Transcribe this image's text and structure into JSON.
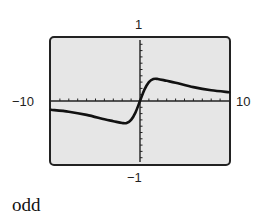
{
  "chart_data": {
    "type": "line",
    "title": "",
    "xlabel": "",
    "ylabel": "",
    "xlim": [
      -10,
      10
    ],
    "ylim": [
      -1,
      1
    ],
    "tick_labels": {
      "xmin": "−10",
      "xmax": "10",
      "ymax": "1",
      "ymin": "−1"
    },
    "x_tick_step": 1,
    "y_tick_step": 0.1,
    "grid": false,
    "series": [
      {
        "name": "f(x)",
        "x": [
          -10,
          -8,
          -6,
          -4,
          -3,
          -2,
          -1.5,
          -1,
          -0.5,
          0,
          0.5,
          1,
          1.5,
          2,
          3,
          4,
          6,
          8,
          10
        ],
        "values": [
          -0.14,
          -0.17,
          -0.22,
          -0.29,
          -0.32,
          -0.35,
          -0.35,
          -0.3,
          -0.18,
          0,
          0.18,
          0.3,
          0.35,
          0.35,
          0.32,
          0.29,
          0.22,
          0.17,
          0.14
        ]
      }
    ]
  },
  "answer": "odd",
  "colors": {
    "plot_bg": "#e6e6e6",
    "frame": "#222222",
    "curve": "#111111"
  }
}
